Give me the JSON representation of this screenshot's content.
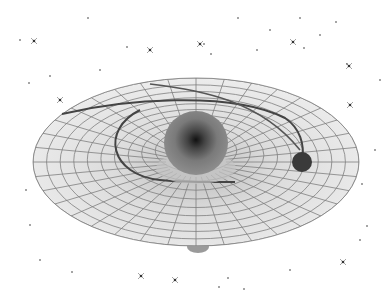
{
  "scene": {
    "description": "Grayscale illustration of a gravity well: a gridded funnel-shaped disk with a central massive sphere, an orbiting smaller body with a spiral trail, a tube descending below the disk, and scattered stars on white background",
    "background": "#ffffff",
    "disk": {
      "cx": 196,
      "cy": 162,
      "rx": 163,
      "ry": 84,
      "fill": "#e8e8e8",
      "grid": "#7a7a7a"
    },
    "central_mass": {
      "cx": 196,
      "cy": 143,
      "r": 32,
      "fill": "#7c7c7c",
      "core": "#1a1a1a"
    },
    "orbiting_body": {
      "cx": 302,
      "cy": 162,
      "r": 10,
      "fill": "#3a3a3a"
    },
    "tube": {
      "x": 187,
      "y": 195,
      "w": 22,
      "h": 57,
      "fill": "#a0a0a0"
    },
    "stars": [
      [
        34,
        41
      ],
      [
        50,
        76
      ],
      [
        29,
        83
      ],
      [
        127,
        47
      ],
      [
        200,
        44
      ],
      [
        204,
        44
      ],
      [
        211,
        54
      ],
      [
        257,
        50
      ],
      [
        293,
        42
      ],
      [
        304,
        48
      ],
      [
        336,
        22
      ],
      [
        347,
        64
      ],
      [
        349,
        66
      ],
      [
        362,
        184
      ],
      [
        367,
        226
      ],
      [
        72,
        272
      ],
      [
        141,
        276
      ],
      [
        219,
        287
      ],
      [
        228,
        278
      ],
      [
        244,
        289
      ],
      [
        343,
        262
      ],
      [
        88,
        18
      ],
      [
        238,
        18
      ],
      [
        20,
        40
      ],
      [
        60,
        100
      ],
      [
        45,
        145
      ],
      [
        26,
        190
      ],
      [
        30,
        225
      ],
      [
        350,
        105
      ],
      [
        375,
        150
      ],
      [
        360,
        240
      ],
      [
        100,
        70
      ],
      [
        150,
        50
      ],
      [
        270,
        30
      ],
      [
        320,
        35
      ],
      [
        300,
        18
      ],
      [
        175,
        280
      ],
      [
        290,
        270
      ],
      [
        40,
        260
      ],
      [
        380,
        80
      ]
    ]
  }
}
